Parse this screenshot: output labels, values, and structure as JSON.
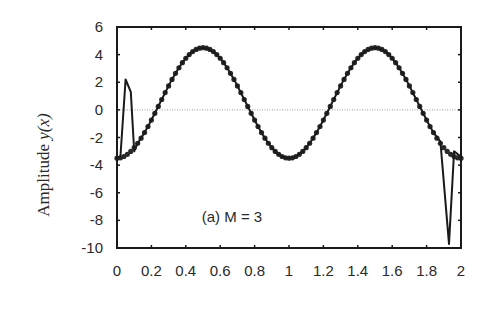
{
  "chart_data": {
    "type": "line",
    "title": "",
    "annotation": "(a) M = 3",
    "xlabel": "",
    "ylabel": "Amplitude y(x)",
    "ylabel_parts": {
      "prefix": "Amplitude ",
      "var": "y(x)"
    },
    "xlim": [
      0,
      2
    ],
    "ylim": [
      -10,
      6
    ],
    "xticks": [
      0,
      0.2,
      0.4,
      0.6,
      0.8,
      1,
      1.2,
      1.4,
      1.6,
      1.8,
      2
    ],
    "xtick_labels": [
      "0",
      "0.2",
      "0.4",
      "0.6",
      "0.8",
      "1",
      "1.2",
      "1.4",
      "1.6",
      "1.8",
      "2"
    ],
    "yticks": [
      6,
      4,
      2,
      0,
      -2,
      -4,
      -6,
      -8,
      -10
    ],
    "ytick_labels": [
      "6",
      "4",
      "2",
      "0",
      "-2",
      "-4",
      "-6",
      "-8",
      "-10"
    ],
    "grid": false,
    "reference_line": {
      "y": 0,
      "style": "dotted"
    },
    "series": [
      {
        "name": "exact (markers)",
        "style": "markers",
        "description": "y = 0.5 - 4 cos(2*pi*x), sampled every 0.02",
        "x_start": 0,
        "x_end": 2,
        "x_step": 0.02,
        "approx_points": [
          [
            0,
            -3.5
          ],
          [
            0.25,
            0.5
          ],
          [
            0.5,
            4.5
          ],
          [
            0.75,
            0.5
          ],
          [
            1.0,
            -3.5
          ],
          [
            1.25,
            0.5
          ],
          [
            1.5,
            4.5
          ],
          [
            1.75,
            0.5
          ],
          [
            2.0,
            -3.5
          ]
        ]
      },
      {
        "name": "approximation (line)",
        "style": "line",
        "description": "follows markers except Gibbs-like spikes near edges",
        "spikes": [
          {
            "x": 0.05,
            "y": 2.2
          },
          {
            "x": 1.93,
            "y": -9.7
          }
        ],
        "approx_points": [
          [
            0,
            -3.5
          ],
          [
            0.02,
            -3.4
          ],
          [
            0.05,
            2.2
          ],
          [
            0.08,
            1.3
          ],
          [
            0.1,
            -3.0
          ],
          [
            0.5,
            4.5
          ],
          [
            1.0,
            -3.5
          ],
          [
            1.5,
            4.5
          ],
          [
            1.88,
            -2.3
          ],
          [
            1.93,
            -9.7
          ],
          [
            1.96,
            -3.0
          ],
          [
            2.0,
            -3.4
          ]
        ]
      }
    ]
  }
}
